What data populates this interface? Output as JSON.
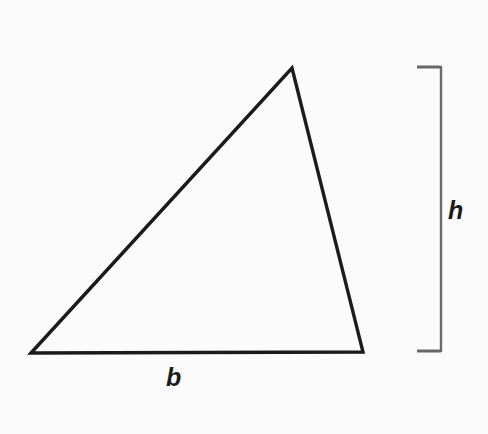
{
  "figure": {
    "background_color": "#fbfbfc",
    "stroke_color": "#1b1b1b",
    "bracket_color": "#555555",
    "labels": {
      "base": "b",
      "height": "h"
    },
    "icons": {
      "triangle": "triangle-outline-icon",
      "bracket": "height-bracket-icon"
    }
  },
  "chart_data": {
    "type": "diagram",
    "title": "",
    "shape": "triangle",
    "vertices": [
      {
        "name": "bottom-left",
        "x": 31,
        "y": 353
      },
      {
        "name": "apex",
        "x": 292,
        "y": 68
      },
      {
        "name": "bottom-right",
        "x": 363,
        "y": 352
      }
    ],
    "annotations": [
      {
        "name": "base-label",
        "text": "b",
        "x": 176,
        "y": 378,
        "refers_to": "bottom edge from (31,353) to (363,352)"
      },
      {
        "name": "height-label",
        "text": "h",
        "x": 458,
        "y": 211,
        "refers_to": "vertical bracket spanning the triangle height"
      }
    ],
    "bracket": {
      "name": "height-bracket",
      "orientation": "vertical",
      "spine_x": 441,
      "y_top": 66,
      "y_bottom": 352,
      "tick_length": 24,
      "tick_direction": "left"
    },
    "xlabel": "",
    "ylabel": "",
    "grid": false,
    "legend": false
  }
}
